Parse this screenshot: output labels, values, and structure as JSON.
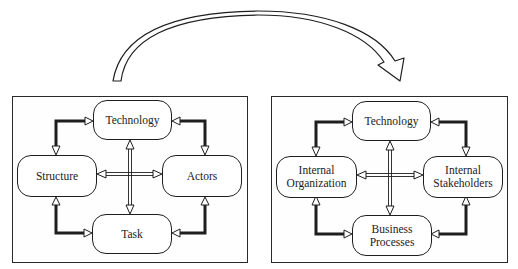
{
  "diagram": {
    "type": "transformation-diagram",
    "transition_arrow": {
      "from": "left-panel",
      "to": "right-panel",
      "shape": "curved-hollow-arrow"
    },
    "left_panel": {
      "nodes": {
        "top": "Technology",
        "left": "Structure",
        "right": "Actors",
        "bottom": "Task"
      }
    },
    "right_panel": {
      "nodes": {
        "top": "Technology",
        "left": "Internal\nOrganization",
        "right": "Internal\nStakeholders",
        "bottom": "Business\nProcesses"
      }
    },
    "connections": [
      {
        "from": "left",
        "to": "top",
        "style": "thick-elbow-bidirectional"
      },
      {
        "from": "top",
        "to": "right",
        "style": "thick-elbow-bidirectional"
      },
      {
        "from": "left",
        "to": "bottom",
        "style": "thick-elbow-bidirectional"
      },
      {
        "from": "right",
        "to": "bottom",
        "style": "thick-elbow-bidirectional"
      },
      {
        "from": "left",
        "to": "right",
        "style": "double-line-bidirectional"
      },
      {
        "from": "top",
        "to": "bottom",
        "style": "double-line-bidirectional"
      }
    ],
    "colors": {
      "stroke": "#1e1e1e",
      "background": "#ffffff"
    }
  }
}
